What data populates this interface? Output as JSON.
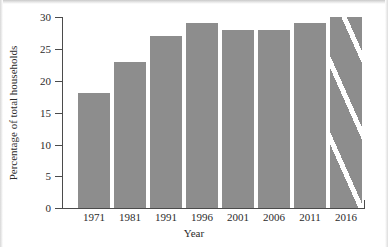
{
  "chart_data": {
    "type": "bar",
    "title": "",
    "xlabel": "Year",
    "ylabel": "Percentage of total households",
    "categories": [
      "1971",
      "1981",
      "1991",
      "1996",
      "2001",
      "2006",
      "2011",
      "2016"
    ],
    "values": [
      18,
      23,
      27,
      29,
      28,
      28,
      29,
      30
    ],
    "ylim": [
      0,
      30
    ],
    "yticks": [
      "0",
      "5",
      "10",
      "15",
      "20",
      "25",
      "30"
    ],
    "ytick_values": [
      0,
      5,
      10,
      15,
      20,
      25,
      30
    ],
    "grid": false,
    "legend": "none",
    "bar_color": "#8d8d8d",
    "axis_color": "#4b4b4b",
    "background": "#ffffff",
    "annotations": [
      {
        "category": "2016",
        "style": "hatched",
        "description": "final bar drawn with white diagonal stripes"
      }
    ]
  }
}
